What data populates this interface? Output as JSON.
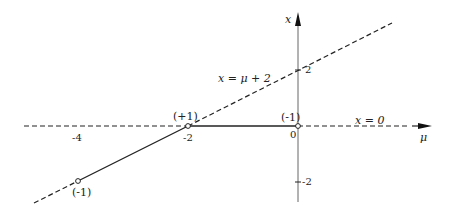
{
  "figure": {
    "axes": {
      "horizontal_label": "μ",
      "vertical_label": "x"
    },
    "tick_labels": {
      "mu_minus4": "-4",
      "mu_minus2": "-2",
      "origin": "0",
      "x_plus2": "2",
      "x_minus2": "-2"
    },
    "curve_labels": {
      "diagonal": "x = μ + 2",
      "horizontal": "x = 0"
    },
    "point_labels": {
      "transcritical": "(+1)",
      "origin_point": "(-1)",
      "lower_point": "(-1)"
    },
    "colors": {
      "line": "#222222",
      "axis": "#555555",
      "background": "#ffffff"
    }
  }
}
